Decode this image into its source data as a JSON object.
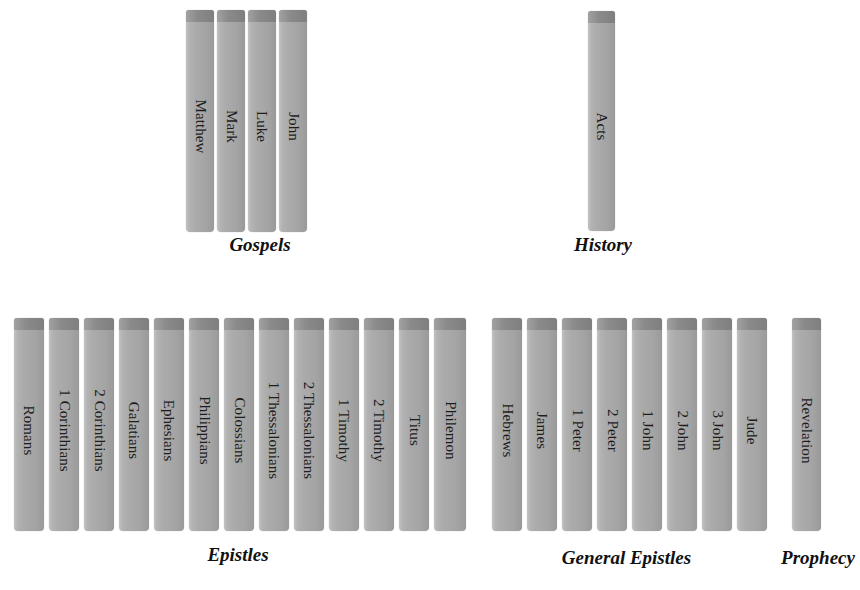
{
  "page": {
    "background_color": "#ffffff",
    "book_color": "#ababab",
    "book_cap_color": "#8d8d8d",
    "text_color": "#1c1c1c"
  },
  "groups": [
    {
      "id": "gospels",
      "caption": "Gospels",
      "caption_x": 199,
      "caption_y": 234,
      "caption_width": 122,
      "row_top": 10,
      "row_height": 222,
      "books": [
        {
          "label": "Matthew",
          "x": 186,
          "width": 28
        },
        {
          "label": "Mark",
          "x": 217,
          "width": 28
        },
        {
          "label": "Luke",
          "x": 248,
          "width": 28
        },
        {
          "label": "John",
          "x": 279,
          "width": 28
        }
      ]
    },
    {
      "id": "history",
      "caption": "History",
      "caption_x": 548,
      "caption_y": 234,
      "caption_width": 110,
      "row_top": 11,
      "row_height": 220,
      "books": [
        {
          "label": "Acts",
          "x": 588,
          "width": 27
        }
      ]
    },
    {
      "id": "epistles",
      "caption": "Epistles",
      "caption_x": 183,
      "caption_y": 544,
      "caption_width": 110,
      "row_top": 318,
      "row_height": 213,
      "books": [
        {
          "label": "Romans",
          "x": 14,
          "width": 30
        },
        {
          "label": "1 Corinthians",
          "x": 49,
          "width": 30
        },
        {
          "label": "2 Corinthians",
          "x": 84,
          "width": 30
        },
        {
          "label": "Galatians",
          "x": 119,
          "width": 30
        },
        {
          "label": "Ephesians",
          "x": 154,
          "width": 30
        },
        {
          "label": "Philippians",
          "x": 189,
          "width": 30
        },
        {
          "label": "Colossians",
          "x": 224,
          "width": 30
        },
        {
          "label": "1 Thessalonians",
          "x": 259,
          "width": 30
        },
        {
          "label": "2 Thessalonians",
          "x": 294,
          "width": 30
        },
        {
          "label": "1 Timothy",
          "x": 329,
          "width": 30
        },
        {
          "label": "2 Timothy",
          "x": 364,
          "width": 30
        },
        {
          "label": "Titus",
          "x": 399,
          "width": 30
        },
        {
          "label": "Philemon",
          "x": 434,
          "width": 32
        }
      ]
    },
    {
      "id": "general-epistles",
      "caption": "General Epistles",
      "caption_x": 524,
      "caption_y": 547,
      "caption_width": 205,
      "row_top": 318,
      "row_height": 213,
      "books": [
        {
          "label": "Hebrews",
          "x": 492,
          "width": 30
        },
        {
          "label": "James",
          "x": 527,
          "width": 30
        },
        {
          "label": "1 Peter",
          "x": 562,
          "width": 30
        },
        {
          "label": "2 Peter",
          "x": 597,
          "width": 30
        },
        {
          "label": "1 John",
          "x": 632,
          "width": 30
        },
        {
          "label": "2 John",
          "x": 667,
          "width": 30
        },
        {
          "label": "3 John",
          "x": 702,
          "width": 30
        },
        {
          "label": "Jude",
          "x": 737,
          "width": 30
        }
      ]
    },
    {
      "id": "prophecy",
      "caption": "Prophecy",
      "caption_x": 753,
      "caption_y": 547,
      "caption_width": 130,
      "row_top": 318,
      "row_height": 213,
      "books": [
        {
          "label": "Revelation",
          "x": 792,
          "width": 29
        }
      ]
    }
  ]
}
